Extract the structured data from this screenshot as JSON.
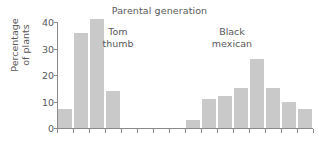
{
  "chart_data": {
    "type": "bar",
    "title": "Parental generation",
    "xlabel": "",
    "ylabel_line1": "Percentage",
    "ylabel_line2": "of plants",
    "ylabel": "Percentage of plants",
    "ylim": [
      0,
      40
    ],
    "yticks": [
      0,
      10,
      20,
      30,
      40
    ],
    "ytick_labels": [
      "0",
      "10",
      "20",
      "30",
      "40"
    ],
    "grid": false,
    "legend": "none",
    "bar_color": "#c9c9c9",
    "axis_color": "#8a8a8a",
    "text_color": "#59595b",
    "n_bins": 16,
    "categories": [
      "1",
      "2",
      "3",
      "4",
      "5",
      "6",
      "7",
      "8",
      "9",
      "10",
      "11",
      "12",
      "13",
      "14",
      "15",
      "16"
    ],
    "values": [
      7,
      36,
      41,
      14,
      0,
      0,
      0,
      0,
      3,
      11,
      12,
      15,
      26,
      15,
      10,
      7
    ],
    "groups": [
      {
        "name": "Tom thumb",
        "label_line1": "Tom",
        "label_line2": "thumb",
        "bin_start": 0,
        "bins": [
          {
            "index": 0,
            "value": 7
          },
          {
            "index": 1,
            "value": 36
          },
          {
            "index": 2,
            "value": 41
          },
          {
            "index": 3,
            "value": 14
          }
        ]
      },
      {
        "name": "Black mexican",
        "label_line1": "Black",
        "label_line2": "mexican",
        "bin_start": 8,
        "bins": [
          {
            "index": 8,
            "value": 3
          },
          {
            "index": 9,
            "value": 11
          },
          {
            "index": 10,
            "value": 12
          },
          {
            "index": 11,
            "value": 15
          },
          {
            "index": 12,
            "value": 26
          },
          {
            "index": 13,
            "value": 15
          },
          {
            "index": 14,
            "value": 10
          },
          {
            "index": 15,
            "value": 7
          }
        ]
      }
    ]
  }
}
